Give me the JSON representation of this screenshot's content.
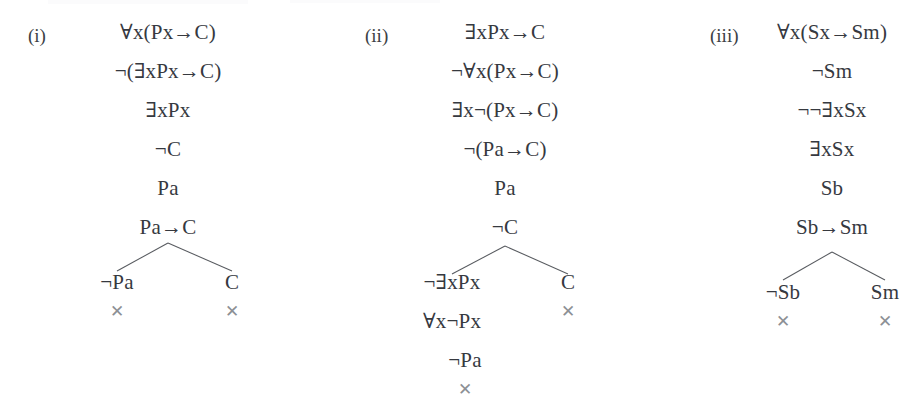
{
  "page": {
    "background": "#ffffff",
    "text_color": "#36393f",
    "close_mark_color": "#8d9095",
    "branch_line_color": "#585b60",
    "close_mark_glyph": "✕"
  },
  "trees": [
    {
      "id": "tree-i",
      "label": "(i)",
      "label_x": 28,
      "label_y": 26,
      "center_x": 168,
      "trunk": [
        {
          "text": "∀x(Px→C)",
          "x": 168,
          "y": 22
        },
        {
          "text": "¬(∃xPx→C)",
          "x": 168,
          "y": 61
        },
        {
          "text": "∃xPx",
          "x": 168,
          "y": 100
        },
        {
          "text": "¬C",
          "x": 168,
          "y": 139
        },
        {
          "text": "Pa",
          "x": 168,
          "y": 178
        },
        {
          "text": "Pa→C",
          "x": 168,
          "y": 217
        }
      ],
      "branch": {
        "apex_x": 168,
        "apex_y": 243,
        "left_x": 117,
        "right_x": 232,
        "foot_y": 271
      },
      "left_branch": [
        {
          "text": "¬Pa",
          "x": 117,
          "y": 272
        }
      ],
      "right_branch": [
        {
          "text": "C",
          "x": 232,
          "y": 272
        }
      ],
      "closures": [
        {
          "x": 117,
          "y": 303
        },
        {
          "x": 232,
          "y": 303
        }
      ]
    },
    {
      "id": "tree-ii",
      "label": "(ii)",
      "label_x": 365,
      "label_y": 26,
      "center_x": 505,
      "trunk": [
        {
          "text": "∃xPx→C",
          "x": 505,
          "y": 22
        },
        {
          "text": "¬∀x(Px→C)",
          "x": 505,
          "y": 61
        },
        {
          "text": "∃x¬(Px→C)",
          "x": 505,
          "y": 100
        },
        {
          "text": "¬(Pa→C)",
          "x": 505,
          "y": 139
        },
        {
          "text": "Pa",
          "x": 505,
          "y": 178
        },
        {
          "text": "¬C",
          "x": 505,
          "y": 217
        }
      ],
      "branch": {
        "apex_x": 505,
        "apex_y": 246,
        "left_x": 452,
        "right_x": 568,
        "foot_y": 274
      },
      "left_branch": [
        {
          "text": "¬∃xPx",
          "x": 452,
          "y": 272
        },
        {
          "text": "∀x¬Px",
          "x": 452,
          "y": 311
        },
        {
          "text": "¬Pa",
          "x": 465,
          "y": 350
        }
      ],
      "right_branch": [
        {
          "text": "C",
          "x": 568,
          "y": 272
        }
      ],
      "closures": [
        {
          "x": 465,
          "y": 381
        },
        {
          "x": 568,
          "y": 303
        }
      ]
    },
    {
      "id": "tree-iii",
      "label": "(iii)",
      "label_x": 710,
      "label_y": 26,
      "center_x": 832,
      "trunk": [
        {
          "text": "∀x(Sx→Sm)",
          "x": 832,
          "y": 22
        },
        {
          "text": "¬Sm",
          "x": 832,
          "y": 61
        },
        {
          "text": "¬¬∃xSx",
          "x": 832,
          "y": 100
        },
        {
          "text": "∃xSx",
          "x": 832,
          "y": 139
        },
        {
          "text": "Sb",
          "x": 832,
          "y": 178
        },
        {
          "text": "Sb→Sm",
          "x": 832,
          "y": 217
        }
      ],
      "branch": {
        "apex_x": 832,
        "apex_y": 252,
        "left_x": 783,
        "right_x": 885,
        "foot_y": 280
      },
      "left_branch": [
        {
          "text": "¬Sb",
          "x": 783,
          "y": 282
        }
      ],
      "right_branch": [
        {
          "text": "Sm",
          "x": 885,
          "y": 282
        }
      ],
      "closures": [
        {
          "x": 783,
          "y": 313
        },
        {
          "x": 885,
          "y": 313
        }
      ]
    }
  ]
}
